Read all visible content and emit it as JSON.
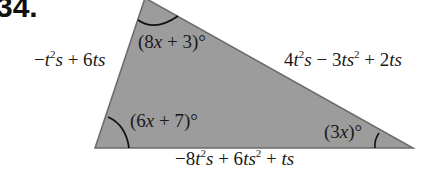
{
  "problem": {
    "number": "34."
  },
  "triangle": {
    "fill_color": "#9c9c9c",
    "edge_color": "#6a6a6a",
    "vertices": {
      "top": [
        145,
        -2
      ],
      "bottom_left": [
        95,
        148
      ],
      "bottom_right": [
        413,
        148
      ]
    },
    "sides": {
      "left": "−t²s + 6ts",
      "right": "4t²s − 3ts² + 2ts",
      "bottom": "−8t²s + 6ts² + ts"
    },
    "angles": {
      "top": "(8x + 3)°",
      "bottom_left": "(6x + 7)°",
      "bottom_right": "(3x)°"
    }
  }
}
